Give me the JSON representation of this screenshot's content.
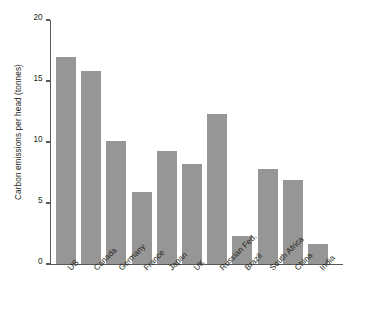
{
  "chart_data": {
    "type": "bar",
    "title": "",
    "xlabel": "",
    "ylabel": "Carbon emissions per head (tonnes)",
    "ylim": [
      0,
      20
    ],
    "yticks": [
      0,
      5,
      10,
      15,
      20
    ],
    "ytick_labels": [
      "0",
      "5",
      "10",
      "15",
      "20"
    ],
    "grid": false,
    "legend": null,
    "bar_color": "#969696",
    "axis_color": "#58595b",
    "text_color": "#231f20",
    "xtick_rotation_degrees": 45,
    "categories": [
      "US",
      "Canada",
      "Germany",
      "France",
      "Japan",
      "UK",
      "Russian Fed.",
      "Brazil",
      "South Africa",
      "China",
      "India"
    ],
    "values": [
      17.0,
      15.8,
      10.1,
      5.9,
      9.3,
      8.2,
      12.3,
      2.3,
      7.8,
      6.9,
      1.6
    ],
    "series": [
      {
        "name": "Carbon emissions per head (tonnes)",
        "values": [
          17.0,
          15.8,
          10.1,
          5.9,
          9.3,
          8.2,
          12.3,
          2.3,
          7.8,
          6.9,
          1.6
        ]
      }
    ]
  }
}
